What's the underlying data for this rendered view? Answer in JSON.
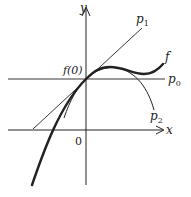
{
  "diagram": {
    "title": "",
    "axes": {
      "x_label": "x",
      "y_label": "y",
      "origin_label": "0"
    },
    "point_label": "f(0)",
    "curves": [
      {
        "id": "f",
        "label": "f",
        "description": "original function (thick curve)"
      },
      {
        "id": "p0",
        "label": "p",
        "sub": "0",
        "description": "constant approximation (horizontal line)"
      },
      {
        "id": "p1",
        "label": "p",
        "sub": "1",
        "description": "linear approximation (tangent line)"
      },
      {
        "id": "p2",
        "label": "p",
        "sub": "2",
        "description": "quadratic approximation (parabola)"
      }
    ],
    "colors": {
      "ink": "#222222",
      "background": "#ffffff"
    }
  }
}
